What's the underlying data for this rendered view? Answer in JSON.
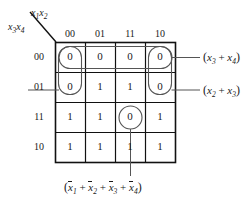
{
  "figure": {
    "type": "karnaugh-map",
    "variables": 4,
    "row_axis_label": "x3x4",
    "col_axis_label": "x1x2",
    "col_headers": [
      "00",
      "01",
      "11",
      "10"
    ],
    "row_headers": [
      "00",
      "01",
      "11",
      "10"
    ],
    "cells": [
      [
        "0",
        "0",
        "0",
        "0"
      ],
      [
        "0",
        "1",
        "1",
        "0"
      ],
      [
        "1",
        "1",
        "0",
        "1"
      ],
      [
        "1",
        "1",
        "1",
        "1"
      ]
    ]
  },
  "axis": {
    "col": {
      "var1": "x",
      "sub1": "1",
      "var2": "x",
      "sub2": "2"
    },
    "row": {
      "var1": "x",
      "sub1": "3",
      "var2": "x",
      "sub2": "4"
    }
  },
  "annotations": {
    "top_right": {
      "text": "(x3 + x4)",
      "terms": [
        {
          "var": "x",
          "sub": "3",
          "bar": false
        },
        {
          "var": "x",
          "sub": "4",
          "bar": false
        }
      ],
      "group": "row-00-all-columns"
    },
    "middle_right": {
      "text": "(x2 + x3)",
      "terms": [
        {
          "var": "x",
          "sub": "2",
          "bar": false
        },
        {
          "var": "x",
          "sub": "3",
          "bar": false
        }
      ],
      "group": "column-00-and-10-rows-00-01"
    },
    "bottom": {
      "text": "(x1bar + x2bar + x3bar + x4bar)",
      "terms": [
        {
          "var": "x",
          "sub": "1",
          "bar": true
        },
        {
          "var": "x",
          "sub": "2",
          "bar": true
        },
        {
          "var": "x",
          "sub": "3",
          "bar": true
        },
        {
          "var": "x",
          "sub": "4",
          "bar": true
        }
      ],
      "group": "cell-row-11-column-11"
    }
  },
  "colors": {
    "ink": "#1a1a1a",
    "grid": "#111111",
    "background": "#ffffff"
  }
}
